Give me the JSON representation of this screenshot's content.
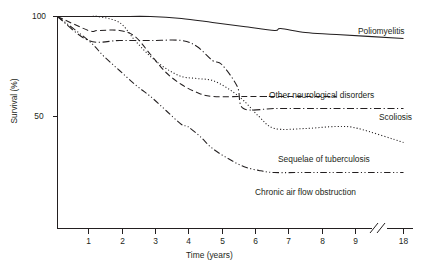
{
  "chart_data": {
    "type": "line",
    "title": "",
    "xlabel": "Time (years)",
    "ylabel": "Survival (%)",
    "xlim": [
      0,
      18
    ],
    "ylim": [
      0,
      100
    ],
    "x_ticks": [
      1,
      2,
      3,
      4,
      5,
      6,
      7,
      8,
      9,
      18
    ],
    "x_tick_labels": [
      "1",
      "2",
      "3",
      "4",
      "5",
      "6",
      "7",
      "8",
      "9",
      "18"
    ],
    "y_ticks": [
      50,
      100
    ],
    "y_tick_labels": [
      "50",
      "100"
    ],
    "axis_break": true,
    "axis_break_between": [
      9,
      18
    ],
    "grid": false,
    "legend_position": "inline-right-of-curve",
    "series": [
      {
        "name": "Poliomyelitis",
        "line_style": "solid",
        "label": "Poliomyelitis",
        "x": [
          0,
          1,
          2,
          3,
          4,
          5,
          6,
          7,
          7.2,
          8,
          9,
          18
        ],
        "y": [
          100,
          100,
          100,
          100,
          99,
          97,
          95,
          93,
          94,
          92,
          91,
          89
        ]
      },
      {
        "name": "Other neurological disorders",
        "line_style": "dashed",
        "label": "Other neurological disorders",
        "x": [
          0,
          1,
          1.3,
          2,
          2.5,
          3,
          3.5,
          4,
          4.5,
          5,
          6,
          7,
          8,
          9
        ],
        "y": [
          100,
          93,
          93,
          93,
          90,
          81,
          72,
          66,
          62,
          60,
          60,
          60,
          60,
          60
        ]
      },
      {
        "name": "Scoliosis",
        "line_style": "dash-dot",
        "label": "Scoliosis",
        "x": [
          0,
          1,
          2,
          3,
          4,
          4.5,
          5,
          5.3,
          5.8,
          6,
          7,
          8,
          9,
          18
        ],
        "y": [
          100,
          88,
          88,
          88,
          88,
          85,
          78,
          76,
          65,
          54,
          54,
          54,
          54,
          54
        ]
      },
      {
        "name": "Sequelae of tuberculosis",
        "line_style": "dotted",
        "label": "Sequelae of tuberculosis",
        "x": [
          0,
          1,
          1.3,
          2,
          2.5,
          3,
          3.5,
          4,
          4.5,
          5,
          5.5,
          6,
          6.5,
          7,
          8,
          9,
          9.5,
          18
        ],
        "y": [
          100,
          100,
          100,
          97,
          88,
          80,
          74,
          70,
          69,
          68,
          64,
          58,
          50,
          44,
          44,
          45,
          44,
          37
        ]
      },
      {
        "name": "Chronic air flow obstruction",
        "line_style": "dash-dot-dot",
        "label": "Chronic air flow obstruction",
        "x": [
          0,
          1,
          1.5,
          2,
          2.5,
          3,
          3.5,
          4,
          4.2,
          4.6,
          5,
          5.5,
          6,
          6.5,
          7,
          8,
          9,
          18
        ],
        "y": [
          100,
          88,
          80,
          73,
          66,
          60,
          53,
          46,
          45,
          40,
          34,
          29,
          25,
          23,
          22,
          22,
          22,
          22
        ]
      }
    ]
  },
  "axis": {
    "x_label": "Time (years)",
    "y_label": "Survival (%)",
    "x_tick_labels": [
      "1",
      "2",
      "3",
      "4",
      "5",
      "6",
      "7",
      "8",
      "9",
      "18"
    ],
    "y_tick_labels": [
      "100",
      "50"
    ]
  },
  "series_labels": {
    "poliomyelitis": "Poliomyelitis",
    "other_neurological": "Other neurological disorders",
    "scoliosis": "Scoliosis",
    "sequelae_tb": "Sequelae of tuberculosis",
    "chronic_airflow": "Chronic air flow obstruction"
  }
}
